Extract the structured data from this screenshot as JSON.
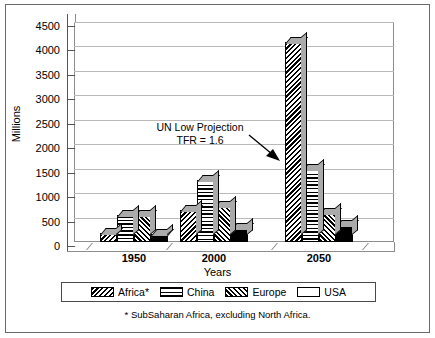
{
  "chart_data": {
    "type": "bar",
    "title": "",
    "xlabel": "Years",
    "ylabel": "Millions",
    "categories": [
      "1950",
      "2000",
      "2050"
    ],
    "series": [
      {
        "name": "Africa*",
        "pattern": "backslash-hatch",
        "values": [
          180,
          650,
          4100
        ]
      },
      {
        "name": "China",
        "pattern": "horizontal-hatch",
        "values": [
          560,
          1270,
          1500
        ]
      },
      {
        "name": "Europe",
        "pattern": "forwardslash-hatch",
        "values": [
          550,
          730,
          600
        ]
      },
      {
        "name": "USA",
        "pattern": "solid-black",
        "values": [
          155,
          280,
          340
        ]
      }
    ],
    "ylim": [
      0,
      4500
    ],
    "ytick_values": [
      0,
      500,
      1000,
      1500,
      2000,
      2500,
      3000,
      3500,
      4000,
      4500
    ],
    "ytick_labels": [
      "0",
      "500",
      "1000",
      "1500",
      "2000",
      "2500",
      "3000",
      "3500",
      "4000",
      "4500"
    ],
    "grid": true,
    "legend_position": "bottom",
    "style": "3d-column",
    "annotations": [
      {
        "name": "un-low-projection-note",
        "line1": "UN Low Projection",
        "line2": "TFR = 1.6",
        "arrow": "points down-right toward the 2050 Africa column"
      }
    ],
    "footnote": "* SubSaharan Africa, excluding North  Africa."
  },
  "axes": {
    "y_title": "Millions",
    "x_title": "Years"
  },
  "legend": {
    "items": [
      {
        "label": "Africa*",
        "pattern": "backslash-hatch"
      },
      {
        "label": "China",
        "pattern": "horizontal-hatch"
      },
      {
        "label": "Europe",
        "pattern": "forwardslash-hatch"
      },
      {
        "label": "USA",
        "pattern": "solid-black"
      }
    ]
  },
  "annotation": {
    "line1": "UN Low Projection",
    "line2": "TFR = 1.6"
  },
  "footnote": {
    "text": "* SubSaharan Africa, excluding North  Africa."
  },
  "colors": {
    "hatch": "#000000",
    "solid": "#000000",
    "bar_side": "#aaaaaa",
    "gridline": "#b9b9b9",
    "frame": "#6a6a6a",
    "background": "#ffffff"
  }
}
